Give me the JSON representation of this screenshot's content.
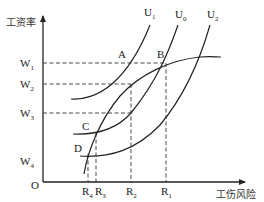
{
  "diagram": {
    "type": "economics-indifference-curve-diagram",
    "axes": {
      "y_label": "工资率",
      "x_label": "工伤风险",
      "origin_label": "O"
    },
    "wage_levels": [
      {
        "name": "W",
        "sub": "1"
      },
      {
        "name": "W",
        "sub": "2"
      },
      {
        "name": "W",
        "sub": "3"
      },
      {
        "name": "W",
        "sub": "4"
      }
    ],
    "risk_levels": [
      {
        "name": "R",
        "sub": "4"
      },
      {
        "name": "R",
        "sub": "3"
      },
      {
        "name": "R",
        "sub": "2"
      },
      {
        "name": "R",
        "sub": "1"
      }
    ],
    "points": [
      "A",
      "B",
      "C",
      "D"
    ],
    "curves": [
      {
        "name": "U",
        "sub": "1"
      },
      {
        "name": "U",
        "sub": "0"
      },
      {
        "name": "U",
        "sub": "2"
      }
    ],
    "colors": {
      "ink": "#222222",
      "background": "#ffffff"
    }
  }
}
